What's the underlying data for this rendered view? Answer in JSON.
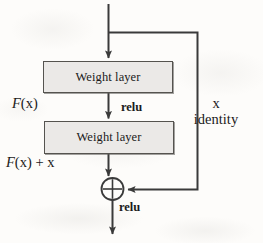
{
  "diagram": {
    "background_color": "#fdfcfa",
    "stroke_color": "#3a3a3a",
    "box_fill_color": "#ebe9e7",
    "box_border_color": "#55534f",
    "blocks": [
      {
        "id": "weight-layer-1",
        "label": "Weight layer"
      },
      {
        "id": "weight-layer-2",
        "label": "Weight layer"
      }
    ],
    "labels": {
      "f_of_x": {
        "italic_part": "F",
        "upright_part": "(x)"
      },
      "f_of_x_plus_x": {
        "italic_part": "F",
        "upright_part": "(x) + x"
      },
      "relu_after_first_layer": "relu",
      "relu_after_addition": "relu",
      "identity_line_1": "x",
      "identity_line_2": "identity"
    },
    "operator": {
      "id": "addition-node",
      "symbol": "+",
      "shape": "circle-plus"
    },
    "edges": [
      {
        "from": "input",
        "to": "weight-layer-1",
        "arrow": true
      },
      {
        "from": "input-branch",
        "to": "addition-node",
        "arrow": true,
        "name": "identity-shortcut"
      },
      {
        "from": "weight-layer-1",
        "to": "weight-layer-2",
        "arrow": true
      },
      {
        "from": "weight-layer-2",
        "to": "addition-node",
        "arrow": true
      },
      {
        "from": "addition-node",
        "to": "output",
        "arrow": true
      }
    ]
  }
}
